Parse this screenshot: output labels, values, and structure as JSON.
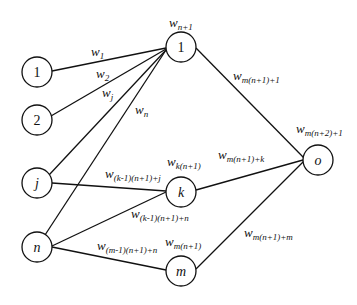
{
  "diagram": {
    "type": "neural-network",
    "nodes": {
      "input_1": {
        "label": "1",
        "italic": false
      },
      "input_2": {
        "label": "2",
        "italic": false
      },
      "input_j": {
        "label": "j",
        "italic": true
      },
      "input_n": {
        "label": "n",
        "italic": true
      },
      "hidden_1": {
        "label": "1",
        "italic": false
      },
      "hidden_k": {
        "label": "k",
        "italic": true
      },
      "hidden_m": {
        "label": "m",
        "italic": true
      },
      "output_o": {
        "label": "o",
        "italic": true
      }
    },
    "weights": {
      "w1": {
        "base": "w",
        "sub": "1"
      },
      "w2": {
        "base": "w",
        "sub": "2"
      },
      "wj": {
        "base": "w",
        "sub": "j"
      },
      "wn": {
        "base": "w",
        "sub": "n"
      },
      "hidden1_bias": {
        "base": "w",
        "sub": "n+1"
      },
      "hiddenk_bias": {
        "base": "w",
        "sub": "k(n+1)"
      },
      "hiddenm_bias": {
        "base": "w",
        "sub": "m(n+1)"
      },
      "j_to_k": {
        "base": "w",
        "sub": "(k-1)(n+1)+j"
      },
      "n_to_k": {
        "base": "w",
        "sub": "(k-1)(n+1)+n"
      },
      "n_to_m": {
        "base": "w",
        "sub": "(m-1)(n+1)+n"
      },
      "h1_to_o": {
        "base": "w",
        "sub": "m(n+1)+1"
      },
      "hk_to_o": {
        "base": "w",
        "sub": "m(n+1)+k"
      },
      "hm_to_o": {
        "base": "w",
        "sub": "m(n+1)+m"
      },
      "output_bias": {
        "base": "w",
        "sub": "m(n+2)+1"
      }
    },
    "edges": [
      {
        "from": "input_1",
        "to": "hidden_1",
        "weight": "w1"
      },
      {
        "from": "input_2",
        "to": "hidden_1",
        "weight": "w2"
      },
      {
        "from": "input_j",
        "to": "hidden_1",
        "weight": "wj"
      },
      {
        "from": "input_n",
        "to": "hidden_1",
        "weight": "wn"
      },
      {
        "from": "input_j",
        "to": "hidden_k",
        "weight": "j_to_k"
      },
      {
        "from": "input_n",
        "to": "hidden_k",
        "weight": "n_to_k"
      },
      {
        "from": "input_n",
        "to": "hidden_m",
        "weight": "n_to_m"
      },
      {
        "from": "hidden_1",
        "to": "output_o",
        "weight": "h1_to_o"
      },
      {
        "from": "hidden_k",
        "to": "output_o",
        "weight": "hk_to_o"
      },
      {
        "from": "hidden_m",
        "to": "output_o",
        "weight": "hm_to_o"
      }
    ]
  }
}
